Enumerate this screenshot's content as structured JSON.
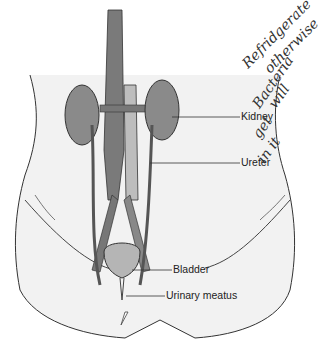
{
  "diagram": {
    "colors": {
      "kidney": "#8a8a8a",
      "vessels": "#6e6e6e",
      "bladder": "#b5b5b5",
      "body_fill": "#f2f2f2",
      "outline": "#333333"
    },
    "labels": [
      {
        "id": "kidney",
        "text": "Kidney"
      },
      {
        "id": "ureter",
        "text": "Ureter"
      },
      {
        "id": "bladder",
        "text": "Bladder"
      },
      {
        "id": "urinary_meatus",
        "text": "Urinary meatus"
      }
    ],
    "handwritten_note": {
      "lines": [
        "Refridgerate",
        "otherwise",
        "Bacteria",
        "will",
        "get",
        "in it"
      ]
    }
  }
}
